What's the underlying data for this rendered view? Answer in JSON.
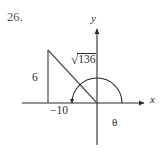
{
  "figure": {
    "problem_number": "26.",
    "axes": {
      "x_label": "x",
      "y_label": "y"
    },
    "labels": {
      "vertical_leg": "6",
      "horizontal_leg": "−10",
      "hypotenuse_radical_sign": "√",
      "hypotenuse_radicand": "136",
      "angle": "θ"
    },
    "colors": {
      "background": "#ffffff",
      "ink": "#2b2b2b",
      "number_ink": "#555555"
    },
    "geometry": {
      "origin_x": 97,
      "origin_y": 103,
      "triangle_top_vertex": [
        48,
        50
      ],
      "triangle_right_angle_vertex": [
        48,
        103
      ],
      "triangle_origin_vertex": [
        97,
        103
      ],
      "x_axis_from": [
        22,
        103
      ],
      "x_axis_to": [
        147,
        103
      ],
      "y_axis_from": [
        97,
        145
      ],
      "y_axis_to": [
        97,
        26
      ],
      "angle_arc_radius": 25,
      "angle_arc_start_deg": 0,
      "angle_arc_sweep_deg": 180,
      "angle_arc_direction": "counterclockwise"
    }
  }
}
